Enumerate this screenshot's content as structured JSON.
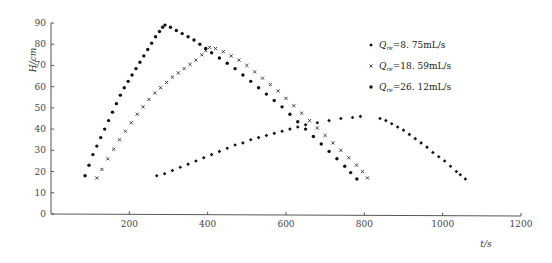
{
  "chart_data": {
    "type": "scatter",
    "title": "",
    "xlabel": "t/s",
    "ylabel": "H/cm",
    "xlim": [
      0,
      1200
    ],
    "ylim": [
      0,
      90
    ],
    "xticks": [
      200,
      400,
      600,
      800,
      1000,
      1200
    ],
    "yticks": [
      0,
      10,
      20,
      30,
      40,
      50,
      60,
      70,
      80,
      90
    ],
    "grid": false,
    "legend_position": "upper right",
    "series": [
      {
        "name": "Q_re=8.75mL/s",
        "label_q": "Q",
        "label_sub": "re",
        "label_value": "=8. 75mL/s",
        "marker": "diamond",
        "x": [
          270,
          290,
          310,
          330,
          350,
          370,
          390,
          410,
          430,
          450,
          470,
          490,
          510,
          530,
          550,
          570,
          590,
          610,
          630,
          650,
          680,
          710,
          740,
          770,
          790,
          840,
          855,
          870,
          885,
          900,
          915,
          930,
          945,
          960,
          975,
          990,
          1005,
          1020,
          1035,
          1045,
          1058
        ],
        "y": [
          18,
          19,
          20.5,
          22,
          23.5,
          25,
          26.5,
          28,
          29.5,
          31,
          32.5,
          33.5,
          35,
          36,
          37,
          38,
          39,
          40,
          41,
          42,
          43,
          44,
          45,
          45.5,
          46,
          45,
          44,
          42.5,
          41,
          39.5,
          37.5,
          35.5,
          33.5,
          31.5,
          29,
          27,
          25,
          22.5,
          20,
          18.5,
          16.5
        ]
      },
      {
        "name": "Q_re=18.59mL/s",
        "label_q": "Q",
        "label_sub": "re",
        "label_value": "=18. 59mL/s",
        "marker": "cross",
        "x": [
          117,
          130,
          145,
          160,
          175,
          190,
          205,
          220,
          235,
          250,
          265,
          280,
          295,
          310,
          325,
          340,
          355,
          370,
          385,
          395,
          405,
          420,
          440,
          460,
          480,
          500,
          520,
          540,
          560,
          580,
          600,
          620,
          640,
          660,
          680,
          700,
          720,
          740,
          760,
          780,
          795,
          808
        ],
        "y": [
          17,
          21,
          26,
          30.5,
          35,
          39,
          43,
          47,
          50.5,
          54,
          57,
          59.5,
          62,
          64.5,
          66.5,
          68.5,
          70.5,
          72.5,
          75,
          77,
          78.5,
          78,
          76.5,
          74.5,
          72.5,
          70,
          67,
          64,
          61,
          58,
          54.5,
          51,
          47.5,
          44,
          40.5,
          37,
          33.5,
          30,
          26.5,
          23,
          20,
          17
        ]
      },
      {
        "name": "Q_re=26.12mL/s",
        "label_q": "Q",
        "label_sub": "re",
        "label_value": "=26. 12mL/s",
        "marker": "circle",
        "x": [
          87,
          97,
          107,
          117,
          127,
          137,
          147,
          157,
          167,
          177,
          187,
          197,
          207,
          217,
          227,
          237,
          247,
          257,
          267,
          277,
          285,
          291,
          305,
          320,
          335,
          350,
          365,
          380,
          395,
          410,
          430,
          450,
          470,
          490,
          510,
          530,
          550,
          570,
          590,
          610,
          630,
          650,
          670,
          690,
          710,
          730,
          750,
          765,
          781
        ],
        "y": [
          18,
          23,
          28,
          32,
          36,
          40,
          44,
          48,
          52,
          56,
          59.5,
          62.5,
          65.5,
          68.5,
          71.5,
          74.5,
          77.5,
          80.5,
          83.5,
          86,
          88,
          89,
          88,
          86.5,
          85,
          83.5,
          82,
          80,
          78,
          76,
          73.5,
          71,
          68.5,
          65.5,
          62.5,
          59.5,
          56.5,
          53.5,
          50.5,
          47,
          43.5,
          40,
          36.5,
          33,
          29.5,
          26,
          22.5,
          19.5,
          16.5
        ]
      }
    ]
  },
  "legend": {
    "items": [
      {
        "q": "Q",
        "sub": "re",
        "value": "=8. 75mL/s",
        "marker": "diamond"
      },
      {
        "q": "Q",
        "sub": "re",
        "value": "=18. 59mL/s",
        "marker": "cross"
      },
      {
        "q": "Q",
        "sub": "re",
        "value": "=26. 12mL/s",
        "marker": "circle"
      }
    ]
  },
  "axes": {
    "x_title": "t/s",
    "y_title": "H/cm"
  }
}
